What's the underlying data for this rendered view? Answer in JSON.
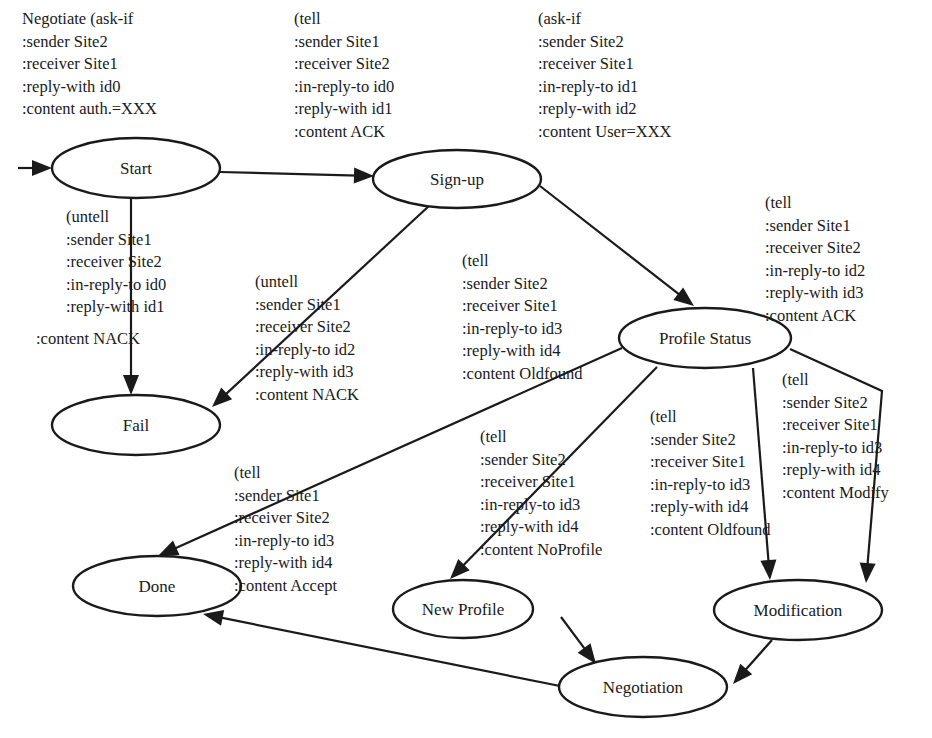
{
  "colors": {
    "stroke": "#1a1a1a",
    "background": "#ffffff"
  },
  "nodes": [
    {
      "id": "start",
      "label": "Start",
      "cx": 136,
      "cy": 168,
      "rx": 84,
      "ry": 30
    },
    {
      "id": "signup",
      "label": "Sign-up",
      "cx": 457,
      "cy": 179,
      "rx": 84,
      "ry": 29
    },
    {
      "id": "fail",
      "label": "Fail",
      "cx": 136,
      "cy": 425,
      "rx": 84,
      "ry": 30
    },
    {
      "id": "profile_status",
      "label": "Profile Status",
      "cx": 705,
      "cy": 338,
      "rx": 86,
      "ry": 30
    },
    {
      "id": "done",
      "label": "Done",
      "cx": 157,
      "cy": 586,
      "rx": 84,
      "ry": 30
    },
    {
      "id": "new_profile",
      "label": "New Profile",
      "cx": 463,
      "cy": 609,
      "rx": 70,
      "ry": 29
    },
    {
      "id": "modification",
      "label": "Modification",
      "cx": 798,
      "cy": 610,
      "rx": 84,
      "ry": 30
    },
    {
      "id": "negotiation",
      "label": "Negotiation",
      "cx": 643,
      "cy": 687,
      "rx": 84,
      "ry": 30
    }
  ],
  "edges": [
    {
      "id": "entry-start",
      "points": [
        [
          18,
          168
        ],
        [
          52,
          168
        ]
      ]
    },
    {
      "id": "start-signup",
      "points": [
        [
          220,
          172
        ],
        [
          374,
          176
        ]
      ]
    },
    {
      "id": "start-fail",
      "points": [
        [
          131,
          198
        ],
        [
          131,
          395
        ]
      ]
    },
    {
      "id": "signup-fail",
      "points": [
        [
          430,
          205
        ],
        [
          212,
          407
        ]
      ]
    },
    {
      "id": "signup-profile",
      "points": [
        [
          540,
          186
        ],
        [
          694,
          306
        ]
      ]
    },
    {
      "id": "profile-done",
      "points": [
        [
          622,
          348
        ],
        [
          158,
          556
        ]
      ]
    },
    {
      "id": "profile-newprofile",
      "points": [
        [
          657,
          367
        ],
        [
          450,
          579
        ]
      ]
    },
    {
      "id": "profile-modification-a",
      "points": [
        [
          753,
          368
        ],
        [
          770,
          580
        ]
      ]
    },
    {
      "id": "profile-modification-b",
      "points": [
        [
          790,
          349
        ],
        [
          882,
          391
        ],
        [
          866,
          583
        ]
      ]
    },
    {
      "id": "newprofile-negotiation",
      "points": [
        [
          561,
          617
        ],
        [
          596,
          664
        ]
      ]
    },
    {
      "id": "modification-negotiation",
      "points": [
        [
          772,
          640
        ],
        [
          733,
          684
        ]
      ]
    },
    {
      "id": "negotiation-done",
      "points": [
        [
          560,
          686
        ],
        [
          203,
          614
        ]
      ]
    }
  ],
  "messages": [
    {
      "id": "msg-start",
      "x": 22,
      "y": 8,
      "lines": [
        "Negotiate (ask-if",
        ":sender Site2",
        ":receiver Site1",
        ":reply-with id0",
        ":content auth.=XXX"
      ]
    },
    {
      "id": "msg-ack-signup",
      "x": 294,
      "y": 8,
      "lines": [
        "(tell",
        ":sender Site1",
        ":receiver Site2",
        ":in-reply-to id0",
        ":reply-with id1",
        ":content ACK"
      ]
    },
    {
      "id": "msg-ask-user",
      "x": 538,
      "y": 8,
      "lines": [
        "(ask-if",
        ":sender Site2",
        ":receiver Site1",
        ":in-reply-to id1",
        ":reply-with id2",
        ":content User=XXX"
      ]
    },
    {
      "id": "msg-nack-start",
      "x": 66,
      "y": 206,
      "lines": [
        "(untell",
        ":sender Site1",
        ":receiver Site2",
        ":in-reply-to id0",
        ":reply-with id1"
      ]
    },
    {
      "id": "msg-nack-start-content",
      "x": 36,
      "y": 328,
      "lines": [
        ":content NACK"
      ]
    },
    {
      "id": "msg-nack-signup",
      "x": 255,
      "y": 271,
      "lines": [
        "(untell",
        ":sender Site1",
        ":receiver Site2",
        ":in-reply-to id2",
        ":reply-with id3",
        ":content NACK"
      ]
    },
    {
      "id": "msg-oldfound-done",
      "x": 462,
      "y": 250,
      "lines": [
        "(tell",
        ":sender Site2",
        ":receiver Site1",
        ":in-reply-to id3",
        ":reply-with id4",
        ":content Oldfound"
      ]
    },
    {
      "id": "msg-ack-profile",
      "x": 765,
      "y": 192,
      "lines": [
        "(tell",
        ":sender Site1",
        ":receiver Site2",
        ":in-reply-to id2",
        ":reply-with id3",
        ":content ACK"
      ]
    },
    {
      "id": "msg-accept",
      "x": 234,
      "y": 462,
      "lines": [
        "(tell",
        ":sender Site1",
        ":receiver Site2",
        ":in-reply-to id3",
        ":reply-with id4",
        ":content Accept"
      ]
    },
    {
      "id": "msg-noprofile",
      "x": 480,
      "y": 426,
      "lines": [
        "(tell",
        ":sender Site2",
        ":receiver Site1",
        ":in-reply-to id3",
        ":reply-with id4",
        ":content NoProfile"
      ]
    },
    {
      "id": "msg-oldfound-mod",
      "x": 650,
      "y": 406,
      "lines": [
        "(tell",
        ":sender Site2",
        ":receiver Site1",
        ":in-reply-to id3",
        ":reply-with id4",
        ":content Oldfound"
      ]
    },
    {
      "id": "msg-modify",
      "x": 782,
      "y": 369,
      "lines": [
        "(tell",
        ":sender Site2",
        ":receiver Site1",
        ":in-reply-to id3",
        ":reply-with id4",
        ":content Modify"
      ]
    }
  ]
}
